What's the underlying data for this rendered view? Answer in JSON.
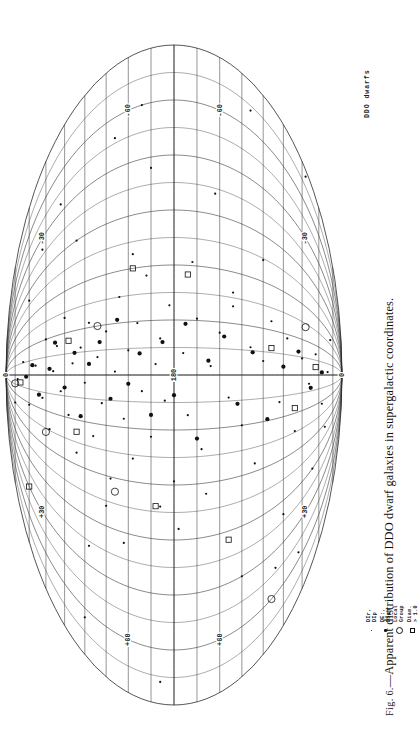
{
  "figure": {
    "caption_prefix": "Fig. 6.",
    "caption_text": "—Apparent distribution of DDO dwarf galaxies in supergalactic coordinates.",
    "plot_title": "DDO dwarfs"
  },
  "legend": {
    "items": [
      {
        "symbol": "small-dot",
        "label": "DIr, DIp"
      },
      {
        "symbol": "filled-dot",
        "label": "DE:, DSph"
      },
      {
        "symbol": "open-circle",
        "label": "Local Group"
      },
      {
        "symbol": "open-square",
        "label": "Diam. > 1.0"
      }
    ]
  },
  "projection": {
    "type": "elliptical-equal-area",
    "coordinate_system": "supergalactic",
    "center_label": "180",
    "pole_label_top": "0",
    "pole_label_bottom": "0",
    "longitude_labels": [
      "+30",
      "+60",
      "-30",
      "-60"
    ],
    "meridian_step_deg": 30,
    "parallel_step_deg": 10,
    "labels": [
      {
        "text": "0",
        "sgl": 0,
        "sgb": 90
      },
      {
        "text": "0",
        "sgl": 0,
        "sgb": -90
      },
      {
        "text": "180",
        "sgl": 0,
        "sgb": 0
      },
      {
        "text": "+30",
        "sgl": -120,
        "sgb": 62
      },
      {
        "text": "-30",
        "sgl": 120,
        "sgb": 62
      },
      {
        "text": "+60",
        "sgl": -150,
        "sgb": 20
      },
      {
        "text": "-60",
        "sgl": 150,
        "sgb": 20
      },
      {
        "text": "+30",
        "sgl": -120,
        "sgb": -62
      },
      {
        "text": "-30",
        "sgl": 120,
        "sgb": -62
      },
      {
        "text": "+60",
        "sgl": -150,
        "sgb": -20
      },
      {
        "text": "-60",
        "sgl": 150,
        "sgb": -20
      }
    ]
  },
  "chart_data": {
    "type": "scatter",
    "title": "DDO dwarfs",
    "xlabel": "supergalactic longitude",
    "ylabel": "supergalactic latitude",
    "xlim": [
      -180,
      180
    ],
    "ylim": [
      -90,
      90
    ],
    "grid": true,
    "legend_position": "bottom-right",
    "series": [
      {
        "name": "DIr, DIp",
        "symbol": "small-dot",
        "points": [
          [
            -6,
            78
          ],
          [
            16,
            74
          ],
          [
            -32,
            70
          ],
          [
            9,
            66
          ],
          [
            -20,
            62
          ],
          [
            30,
            60
          ],
          [
            -44,
            58
          ],
          [
            3,
            56
          ],
          [
            22,
            54
          ],
          [
            -12,
            52
          ],
          [
            41,
            50
          ],
          [
            -28,
            48
          ],
          [
            8,
            46
          ],
          [
            -52,
            44
          ],
          [
            18,
            42
          ],
          [
            -5,
            40
          ],
          [
            33,
            38
          ],
          [
            -38,
            36
          ],
          [
            11,
            34
          ],
          [
            -17,
            32
          ],
          [
            26,
            30
          ],
          [
            -61,
            28
          ],
          [
            2,
            26
          ],
          [
            45,
            24
          ],
          [
            -25,
            22
          ],
          [
            14,
            20
          ],
          [
            -47,
            18
          ],
          [
            29,
            16
          ],
          [
            -9,
            14
          ],
          [
            55,
            12
          ],
          [
            -34,
            10
          ],
          [
            6,
            8
          ],
          [
            20,
            6
          ],
          [
            -14,
            4
          ],
          [
            38,
            2
          ],
          [
            -58,
            0
          ],
          [
            12,
            -4
          ],
          [
            -22,
            -6
          ],
          [
            31,
            -10
          ],
          [
            -41,
            -12
          ],
          [
            5,
            -16
          ],
          [
            24,
            -20
          ],
          [
            -13,
            -24
          ],
          [
            48,
            -26
          ],
          [
            -30,
            -30
          ],
          [
            17,
            -34
          ],
          [
            -55,
            -36
          ],
          [
            9,
            -40
          ],
          [
            36,
            -44
          ],
          [
            -19,
            -48
          ],
          [
            27,
            -52
          ],
          [
            -44,
            -56
          ],
          [
            14,
            -60
          ],
          [
            -8,
            -64
          ],
          [
            21,
            -68
          ],
          [
            -33,
            -72
          ],
          [
            4,
            -76
          ],
          [
            40,
            -26
          ],
          [
            -66,
            -14
          ],
          [
            62,
            -8
          ],
          [
            -72,
            6
          ],
          [
            68,
            18
          ],
          [
            -78,
            30
          ],
          [
            74,
            -40
          ],
          [
            -84,
            -2
          ],
          [
            90,
            44
          ],
          [
            -96,
            22
          ],
          [
            102,
            -18
          ],
          [
            -108,
            38
          ],
          [
            114,
            10
          ],
          [
            -120,
            -30
          ],
          [
            126,
            52
          ],
          [
            -132,
            -46
          ],
          [
            138,
            26
          ],
          [
            -144,
            -58
          ],
          [
            150,
            14
          ],
          [
            -156,
            40
          ],
          [
            162,
            -34
          ],
          [
            -168,
            6
          ],
          [
            174,
            -62
          ],
          [
            -100,
            -50
          ],
          [
            110,
            62
          ],
          [
            -90,
            -66
          ],
          [
            80,
            70
          ],
          [
            -64,
            -74
          ],
          [
            52,
            -78
          ],
          [
            -46,
            80
          ]
        ]
      },
      {
        "name": "DE:, DSph",
        "symbol": "filled-dot",
        "points": [
          [
            -2,
            72
          ],
          [
            10,
            68
          ],
          [
            -18,
            64
          ],
          [
            5,
            58
          ],
          [
            25,
            55
          ],
          [
            -9,
            50
          ],
          [
            15,
            45
          ],
          [
            -27,
            42
          ],
          [
            7,
            38
          ],
          [
            20,
            33
          ],
          [
            -14,
            28
          ],
          [
            32,
            25
          ],
          [
            -5,
            20
          ],
          [
            12,
            15
          ],
          [
            -22,
            10
          ],
          [
            18,
            5
          ],
          [
            -11,
            0
          ],
          [
            28,
            -5
          ],
          [
            -35,
            -10
          ],
          [
            8,
            -15
          ],
          [
            22,
            -22
          ],
          [
            -17,
            -28
          ],
          [
            14,
            -35
          ],
          [
            -29,
            -42
          ],
          [
            6,
            -50
          ],
          [
            19,
            -58
          ],
          [
            -12,
            -65
          ],
          [
            3,
            -72
          ]
        ]
      },
      {
        "name": "Local Group",
        "symbol": "open-circle",
        "points": [
          [
            -14,
            80
          ],
          [
            -48,
            60
          ],
          [
            30,
            34
          ],
          [
            -68,
            26
          ],
          [
            42,
            -62
          ],
          [
            -150,
            -44
          ]
        ]
      },
      {
        "name": "Diam. > 1.0",
        "symbol": "open-square",
        "points": [
          [
            -10,
            76
          ],
          [
            24,
            48
          ],
          [
            -38,
            44
          ],
          [
            60,
            18
          ],
          [
            -72,
            8
          ],
          [
            55,
            -6
          ],
          [
            -95,
            -24
          ],
          [
            18,
            -44
          ],
          [
            -26,
            -56
          ],
          [
            8,
            -68
          ],
          [
            -120,
            70
          ]
        ]
      }
    ]
  }
}
